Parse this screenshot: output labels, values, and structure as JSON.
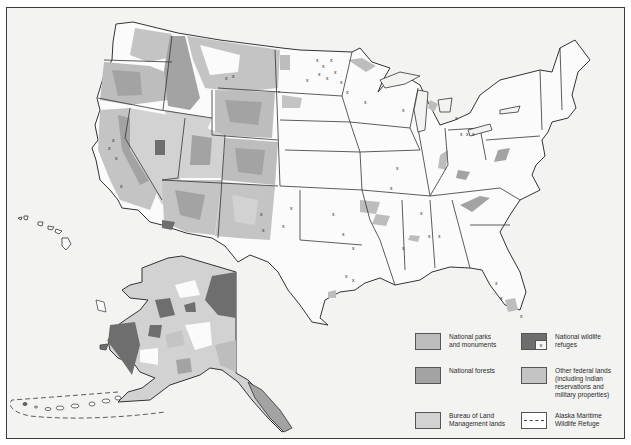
{
  "map": {
    "title": "",
    "colors": {
      "background": "#f3f3f2",
      "land_white": "#fbfbfb",
      "national_parks": "#bdbdbd",
      "national_forests": "#a3a3a3",
      "blm_lands": "#d2d2d2",
      "wildlife_refuges": "#6e6e6e",
      "other_federal": "#c4c4c4",
      "border": "#333333"
    },
    "regions_shown": [
      "Contiguous United States",
      "Alaska",
      "Hawaii"
    ],
    "symbols": {
      "wildlife_refuge_marker": "x",
      "maritime_refuge_line": "dashed"
    }
  },
  "legend": {
    "items": [
      {
        "id": "national-parks",
        "label": "National parks\nand monuments",
        "swatch": "national_parks",
        "color": "#bdbdbd"
      },
      {
        "id": "national-wildlife-refuges",
        "label": "National wildlife\nrefuges",
        "swatch": "wildlife_refuges",
        "color": "#6e6e6e",
        "marker": "x"
      },
      {
        "id": "national-forests",
        "label": "National forests",
        "swatch": "national_forests",
        "color": "#a3a3a3"
      },
      {
        "id": "other-federal-lands",
        "label": "Other federal lands\n(including Indian\nreservations and\nmilitary properties)",
        "swatch": "other_federal",
        "color": "#c4c4c4"
      },
      {
        "id": "blm-lands",
        "label": "Bureau of Land\nManagement lands",
        "swatch": "blm_lands",
        "color": "#d2d2d2"
      },
      {
        "id": "alaska-maritime",
        "label": "Alaska Maritime\nWildlife Refuge",
        "swatch": "dashed",
        "color": "#ffffff"
      }
    ],
    "refuge_marker": "x"
  }
}
